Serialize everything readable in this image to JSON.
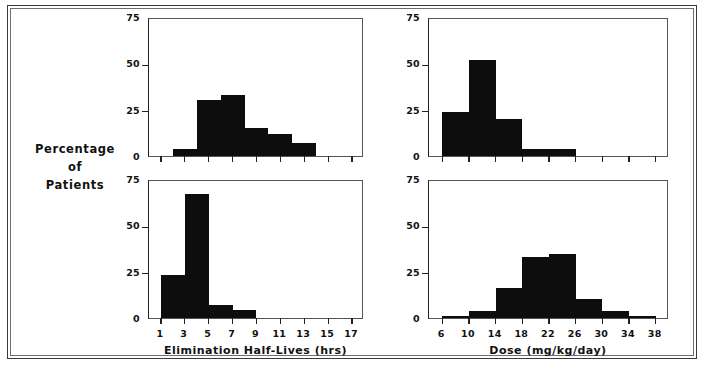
{
  "figure": {
    "y_supertitle_lines": [
      "Percentage",
      "of",
      "Patients"
    ],
    "bar_color": "#0d0d0d",
    "frame_color": "#3a3a3a",
    "axis_color": "#222222"
  },
  "chart_data": [
    {
      "id": "top-left",
      "type": "bar",
      "title": "",
      "xlabel": "",
      "ylabel": "Percentage of Patients",
      "xlim": [
        0,
        18
      ],
      "ylim": [
        0,
        75
      ],
      "yticks": [
        0,
        25,
        50,
        75
      ],
      "ytick_labels": [
        "0",
        "25",
        "50",
        "75"
      ],
      "xticks": [
        1,
        3,
        5,
        7,
        9,
        11,
        13,
        15,
        17
      ],
      "xtick_labels": [
        "",
        "",
        "",
        "",
        "",
        "",
        "",
        "",
        ""
      ],
      "grid": false,
      "legend": "none",
      "bins": [
        {
          "x0": 2,
          "x1": 4,
          "value": 4
        },
        {
          "x0": 4,
          "x1": 6,
          "value": 30
        },
        {
          "x0": 6,
          "x1": 8,
          "value": 33
        },
        {
          "x0": 8,
          "x1": 10,
          "value": 15
        },
        {
          "x0": 10,
          "x1": 12,
          "value": 12
        },
        {
          "x0": 12,
          "x1": 14,
          "value": 7
        }
      ]
    },
    {
      "id": "top-right",
      "type": "bar",
      "title": "",
      "xlabel": "",
      "ylabel": "Percentage of Patients",
      "xlim": [
        4,
        40
      ],
      "ylim": [
        0,
        75
      ],
      "yticks": [
        0,
        25,
        50,
        75
      ],
      "ytick_labels": [
        "0",
        "25",
        "50",
        "75"
      ],
      "xticks": [
        6,
        10,
        14,
        18,
        22,
        26,
        30,
        34,
        38
      ],
      "xtick_labels": [
        "",
        "",
        "",
        "",
        "",
        "",
        "",
        "",
        ""
      ],
      "grid": false,
      "legend": "none",
      "bins": [
        {
          "x0": 6,
          "x1": 10,
          "value": 24
        },
        {
          "x0": 10,
          "x1": 14,
          "value": 52
        },
        {
          "x0": 14,
          "x1": 18,
          "value": 20
        },
        {
          "x0": 18,
          "x1": 26,
          "value": 4
        }
      ]
    },
    {
      "id": "bottom-left",
      "type": "bar",
      "title": "",
      "xlabel": "Elimination Half-Lives (hrs)",
      "ylabel": "Percentage of Patients",
      "xlim": [
        0,
        18
      ],
      "ylim": [
        0,
        75
      ],
      "yticks": [
        0,
        25,
        50,
        75
      ],
      "ytick_labels": [
        "0",
        "25",
        "50",
        "75"
      ],
      "xticks": [
        1,
        3,
        5,
        7,
        9,
        11,
        13,
        15,
        17
      ],
      "xtick_labels": [
        "1",
        "3",
        "5",
        "7",
        "9",
        "11",
        "13",
        "15",
        "17"
      ],
      "grid": false,
      "legend": "none",
      "bins": [
        {
          "x0": 1,
          "x1": 3,
          "value": 23
        },
        {
          "x0": 3,
          "x1": 5,
          "value": 67
        },
        {
          "x0": 5,
          "x1": 7,
          "value": 7
        },
        {
          "x0": 7,
          "x1": 9,
          "value": 4.5
        }
      ]
    },
    {
      "id": "bottom-right",
      "type": "bar",
      "title": "",
      "xlabel": "Dose (mg/kg/day)",
      "ylabel": "Percentage of Patients",
      "xlim": [
        4,
        40
      ],
      "ylim": [
        0,
        75
      ],
      "yticks": [
        0,
        25,
        50,
        75
      ],
      "ytick_labels": [
        "0",
        "25",
        "50",
        "75"
      ],
      "xticks": [
        6,
        10,
        14,
        18,
        22,
        26,
        30,
        34,
        38
      ],
      "xtick_labels": [
        "6",
        "10",
        "14",
        "18",
        "22",
        "26",
        "30",
        "34",
        "38"
      ],
      "grid": false,
      "legend": "none",
      "bins": [
        {
          "x0": 6,
          "x1": 10,
          "value": 1
        },
        {
          "x0": 10,
          "x1": 14,
          "value": 4
        },
        {
          "x0": 14,
          "x1": 18,
          "value": 16
        },
        {
          "x0": 18,
          "x1": 22,
          "value": 33
        },
        {
          "x0": 22,
          "x1": 26,
          "value": 34.5
        },
        {
          "x0": 26,
          "x1": 30,
          "value": 10
        },
        {
          "x0": 30,
          "x1": 34,
          "value": 4
        },
        {
          "x0": 34,
          "x1": 38,
          "value": 1
        }
      ]
    }
  ]
}
